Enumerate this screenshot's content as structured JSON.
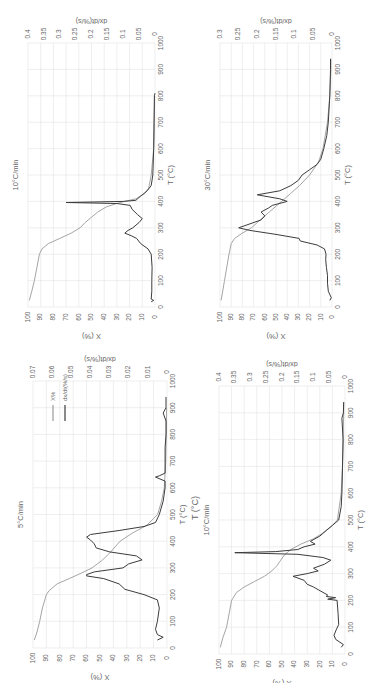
{
  "figure": {
    "orientation": "rotated-90-ccw",
    "colors": {
      "x_percent": "#9a9a9a",
      "dxdt": "#3c3c3c",
      "grid": "#e2e2e2",
      "axis_text": "#666666"
    },
    "stray_label": "T (°C)"
  },
  "chart_data": [
    {
      "id": "panel-10-top",
      "type": "line",
      "title": "10°C/min",
      "xlabel": "T (°C)",
      "ylabel": "X (%)",
      "y2label": "dx/dt(%/s)",
      "xlim": [
        0,
        1000
      ],
      "xticks": [
        0,
        100,
        200,
        300,
        400,
        500,
        600,
        700,
        800,
        900,
        1000
      ],
      "ylim": [
        0,
        100
      ],
      "yticks": [
        0,
        10,
        20,
        30,
        40,
        50,
        60,
        70,
        80,
        90,
        100
      ],
      "y2lim": [
        0,
        0.4
      ],
      "y2ticks": [
        "0",
        "0.05",
        "0.1",
        "0.15",
        "0.2",
        "0.25",
        "0.3",
        "0.35",
        "0.4"
      ],
      "grid": true,
      "box": {
        "left": 28,
        "right": 155,
        "top": 43,
        "bottom": 307
      },
      "series": [
        {
          "name": "X%",
          "axis": "y",
          "x": [
            25,
            60,
            100,
            150,
            200,
            220,
            240,
            260,
            280,
            300,
            320,
            340,
            360,
            380,
            395,
            410,
            430,
            450,
            500,
            600,
            700,
            800
          ],
          "values": [
            99,
            97,
            95,
            93,
            91,
            89,
            84,
            75,
            66,
            59,
            55,
            50,
            45,
            38,
            28,
            15,
            8,
            5,
            3,
            1,
            0.5,
            0.3
          ]
        },
        {
          "name": "dx/dt(%/s)",
          "axis": "y2",
          "x": [
            20,
            25,
            30,
            60,
            100,
            150,
            200,
            220,
            240,
            260,
            270,
            280,
            290,
            300,
            320,
            335,
            350,
            370,
            385,
            392,
            396,
            400,
            404,
            410,
            420,
            430,
            440,
            460,
            500,
            600,
            700,
            800,
            810
          ],
          "values": [
            0.012,
            0.004,
            0.012,
            0.01,
            0.01,
            0.009,
            0.012,
            0.022,
            0.045,
            0.058,
            0.075,
            0.095,
            0.085,
            0.07,
            0.05,
            0.04,
            0.055,
            0.072,
            0.078,
            0.12,
            0.28,
            0.1,
            0.06,
            0.055,
            0.045,
            0.035,
            0.025,
            0.012,
            0.007,
            0.004,
            0.003,
            0.002,
            0.0
          ]
        }
      ]
    },
    {
      "id": "panel-30",
      "type": "line",
      "title": "30°C/min",
      "xlabel": "T (°C)",
      "ylabel": "X (%)",
      "y2label": "dx/dt(%/s)",
      "xlim": [
        0,
        1000
      ],
      "xticks": [
        0,
        100,
        200,
        300,
        400,
        500,
        600,
        700,
        800,
        900,
        1000
      ],
      "ylim": [
        0,
        100
      ],
      "yticks": [
        0,
        10,
        20,
        30,
        40,
        50,
        60,
        70,
        80,
        90,
        100
      ],
      "y2lim": [
        0,
        0.3
      ],
      "y2ticks": [
        "0",
        "0.05",
        "0.1",
        "0.15",
        "0.2",
        "0.25",
        "0.3"
      ],
      "grid": true,
      "box": {
        "left": 220,
        "right": 332,
        "top": 43,
        "bottom": 307
      },
      "series": [
        {
          "name": "X%",
          "axis": "y",
          "x": [
            25,
            100,
            200,
            240,
            260,
            280,
            300,
            330,
            360,
            400,
            430,
            460,
            500,
            550,
            600,
            700,
            800,
            900,
            940
          ],
          "values": [
            99,
            96,
            92,
            90,
            87,
            80,
            72,
            64,
            56,
            45,
            37,
            29,
            20,
            12,
            8,
            4,
            2,
            1,
            1
          ]
        },
        {
          "name": "dx/dt(%/s)",
          "axis": "y2",
          "x": [
            25,
            35,
            60,
            90,
            120,
            150,
            180,
            200,
            220,
            235,
            250,
            260,
            275,
            290,
            300,
            310,
            330,
            345,
            360,
            375,
            385,
            400,
            410,
            425,
            440,
            460,
            480,
            500,
            520,
            540,
            560,
            600,
            650,
            700,
            800,
            900,
            940
          ],
          "values": [
            0.006,
            0.002,
            0.01,
            0.012,
            0.012,
            0.015,
            0.017,
            0.016,
            0.02,
            0.04,
            0.085,
            0.088,
            0.15,
            0.22,
            0.25,
            0.23,
            0.19,
            0.18,
            0.19,
            0.17,
            0.16,
            0.12,
            0.14,
            0.2,
            0.14,
            0.11,
            0.09,
            0.08,
            0.06,
            0.04,
            0.03,
            0.022,
            0.014,
            0.01,
            0.006,
            0.004,
            0.004
          ]
        }
      ]
    },
    {
      "id": "panel-5",
      "type": "line",
      "title": "5°C/min",
      "xlabel": "T (°C)",
      "ylabel": "X (%)",
      "y2label": "dx/dt(%/s)",
      "legend": [
        {
          "label": "X%"
        },
        {
          "label": "dx/dt(%/s)"
        }
      ],
      "xlim": [
        0,
        1000
      ],
      "xticks": [
        0,
        100,
        200,
        300,
        400,
        500,
        600,
        700,
        800,
        900,
        1000
      ],
      "ylim": [
        0,
        100
      ],
      "yticks": [
        0,
        10,
        20,
        30,
        40,
        50,
        60,
        70,
        80,
        90,
        100
      ],
      "y2lim": [
        0,
        0.07
      ],
      "y2ticks": [
        "0",
        "0.01",
        "0.02",
        "0.03",
        "0.04",
        "0.05",
        "0.06",
        "0.07"
      ],
      "grid": true,
      "box": {
        "left": 33,
        "right": 167,
        "top": 381,
        "bottom": 648
      },
      "series": [
        {
          "name": "X%",
          "axis": "y",
          "x": [
            30,
            60,
            100,
            150,
            200,
            215,
            240,
            260,
            280,
            300,
            330,
            360,
            400,
            430,
            460,
            500,
            550,
            600,
            700,
            800,
            900
          ],
          "values": [
            99,
            97,
            95,
            93,
            90,
            88,
            82,
            73,
            64,
            56,
            48,
            42,
            35,
            26,
            15,
            7,
            4,
            2,
            1,
            0.5,
            0.3
          ]
        },
        {
          "name": "dx/dt(%/s)",
          "axis": "y2",
          "x": [
            30,
            40,
            50,
            70,
            100,
            150,
            180,
            200,
            220,
            240,
            260,
            270,
            275,
            285,
            300,
            315,
            330,
            345,
            360,
            375,
            390,
            405,
            415,
            425,
            440,
            455,
            470,
            500,
            550,
            600,
            625,
            640,
            645,
            655,
            700,
            750,
            800,
            850,
            880,
            900,
            940
          ],
          "values": [
            0.005,
            0.002,
            0.005,
            0.006,
            0.005,
            0.004,
            0.005,
            0.012,
            0.022,
            0.025,
            0.033,
            0.042,
            0.042,
            0.038,
            0.023,
            0.02,
            0.013,
            0.016,
            0.03,
            0.037,
            0.038,
            0.04,
            0.042,
            0.04,
            0.025,
            0.012,
            0.006,
            0.004,
            0.002,
            0.001,
            0.001,
            0.006,
            0.004,
            0.001,
            0.001,
            0.001,
            0.0005,
            0.0005,
            0.002,
            0.0005,
            0.0005
          ]
        }
      ]
    },
    {
      "id": "panel-10-bottom",
      "type": "line",
      "title": "10°C/min",
      "xlabel": "T (°C)",
      "ylabel": "X (%)",
      "y2label": "dx/dt(%/s)",
      "xlim": [
        0,
        1000
      ],
      "xticks": [
        0,
        100,
        200,
        300,
        400,
        500,
        600,
        700,
        800,
        900,
        1000
      ],
      "ylim": [
        0,
        100
      ],
      "yticks": [
        0,
        10,
        20,
        30,
        40,
        50,
        60,
        70,
        80,
        90,
        100
      ],
      "y2lim": [
        0,
        0.4
      ],
      "y2ticks": [
        "0",
        "0.05",
        "0.1",
        "0.15",
        "0.2",
        "0.25",
        "0.3",
        "0.35",
        "0.4"
      ],
      "grid": true,
      "box": {
        "left": 219,
        "right": 345,
        "top": 386,
        "bottom": 654
      },
      "series": [
        {
          "name": "X%",
          "axis": "y",
          "x": [
            25,
            60,
            100,
            150,
            200,
            230,
            250,
            270,
            290,
            310,
            330,
            350,
            370,
            390,
            410,
            430,
            450,
            480,
            500,
            600,
            700,
            800,
            900,
            940
          ],
          "values": [
            99,
            97,
            94,
            92,
            90,
            86,
            80,
            72,
            64,
            58,
            54,
            51,
            48,
            43,
            35,
            25,
            18,
            10,
            6,
            3,
            2,
            1.5,
            1,
            1
          ]
        },
        {
          "name": "dx/dt(%/s)",
          "axis": "y2",
          "x": [
            25,
            35,
            55,
            70,
            90,
            110,
            150,
            200,
            205,
            210,
            215,
            220,
            240,
            250,
            260,
            275,
            290,
            300,
            310,
            320,
            335,
            350,
            360,
            372,
            378,
            382,
            390,
            400,
            410,
            420,
            440,
            460,
            480,
            500,
            550,
            600,
            700,
            800,
            880,
            900,
            940
          ],
          "values": [
            0.012,
            0.005,
            0.03,
            0.035,
            0.028,
            0.02,
            0.022,
            0.025,
            0.055,
            0.03,
            0.06,
            0.055,
            0.085,
            0.1,
            0.12,
            0.13,
            0.165,
            0.12,
            0.085,
            0.1,
            0.065,
            0.045,
            0.07,
            0.15,
            0.35,
            0.22,
            0.15,
            0.13,
            0.095,
            0.11,
            0.08,
            0.06,
            0.04,
            0.02,
            0.012,
            0.01,
            0.008,
            0.006,
            0.01,
            0.005,
            0.004
          ]
        }
      ]
    }
  ]
}
